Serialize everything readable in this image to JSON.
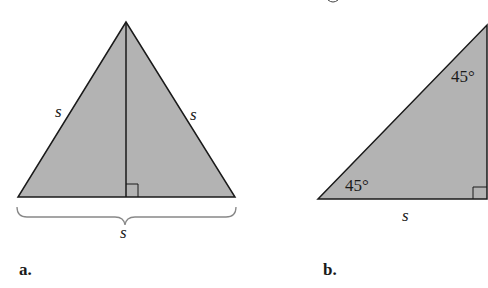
{
  "figure_a": {
    "label": "a.",
    "left_side": "s",
    "right_side": "s",
    "base": "s",
    "description": "Equilateral triangle with altitude and right-angle mark"
  },
  "figure_b": {
    "label": "b.",
    "top_angle": "45°",
    "bottom_angle": "45°",
    "base": "s",
    "description": "Isosceles right triangle"
  },
  "colors": {
    "fill": "#b3b3b3",
    "stroke": "#1a1a1a",
    "brace": "#888888"
  }
}
